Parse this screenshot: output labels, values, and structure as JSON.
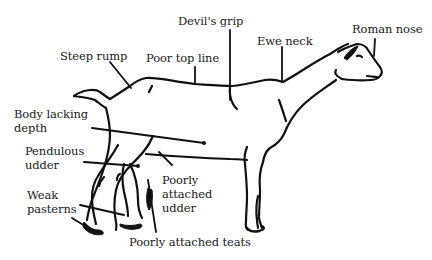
{
  "diagram": {
    "ink_color": "#111111",
    "background": "#ffffff",
    "labels": [
      {
        "id": "devils-grip",
        "text": "Devil's grip"
      },
      {
        "id": "roman-nose",
        "text": "Roman nose"
      },
      {
        "id": "ewe-neck",
        "text": "Ewe neck"
      },
      {
        "id": "steep-rump",
        "text": "Steep rump"
      },
      {
        "id": "poor-top-line",
        "text": "Poor top line"
      },
      {
        "id": "body-lacking-depth",
        "text": "Body lacking\ndepth"
      },
      {
        "id": "pendulous-udder",
        "text": "Pendulous\nudder"
      },
      {
        "id": "poorly-attached-udder",
        "text": "Poorly\nattached\nudder"
      },
      {
        "id": "weak-pasterns",
        "text": "Weak\npasterns"
      },
      {
        "id": "poorly-attached-teats",
        "text": "Poorly attached teats"
      }
    ]
  }
}
